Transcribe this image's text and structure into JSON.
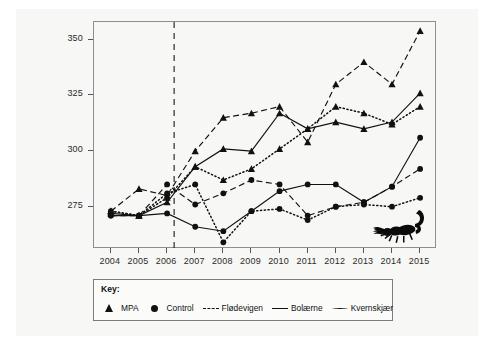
{
  "figure": {
    "background": "#f7f7f5",
    "frame_color": "#8e8e8e"
  },
  "chart_data": {
    "type": "line",
    "title": "",
    "xlabel": "",
    "ylabel": "90% percentile / mm",
    "x": [
      2004,
      2005,
      2006,
      2007,
      2008,
      2009,
      2010,
      2011,
      2012,
      2013,
      2014,
      2015
    ],
    "xtick_labels": [
      "2004",
      "2005",
      "2006",
      "2007",
      "2008",
      "2009",
      "2010",
      "2011",
      "2012",
      "2013",
      "2014",
      "2015"
    ],
    "ytick_labels": [
      "275",
      "300",
      "325",
      "350"
    ],
    "yticks": [
      275,
      300,
      325,
      350
    ],
    "ylim": [
      256,
      358
    ],
    "xlim": [
      2003.4,
      2015.6
    ],
    "grid": false,
    "legend_position": "below-plot",
    "annotations": [
      {
        "name": "protection-start-line",
        "type": "vline",
        "x": 2006.25,
        "style": "dashed"
      },
      {
        "name": "scorpion-illustration",
        "type": "image",
        "x": 2014.3,
        "y": 262
      }
    ],
    "series": [
      {
        "name": "Flødevigen MPA",
        "site": "Flødevigen",
        "group": "MPA",
        "marker": "triangle",
        "line_style": "dashed",
        "color": "#111111",
        "values": [
          273,
          283,
          280,
          300,
          315,
          317,
          320,
          304,
          330,
          340,
          330,
          354
        ]
      },
      {
        "name": "Bolærne MPA",
        "site": "Bolærne",
        "group": "MPA",
        "marker": "triangle",
        "line_style": "solid",
        "color": "#111111",
        "values": [
          272,
          271,
          277,
          293,
          301,
          300,
          317,
          310,
          313,
          310,
          313,
          326
        ]
      },
      {
        "name": "Kvernskjær MPA",
        "site": "Kvernskjær",
        "group": "MPA",
        "marker": "triangle",
        "line_style": "dotted",
        "color": "#111111",
        "values": [
          273,
          271,
          279,
          293,
          287,
          292,
          301,
          310,
          320,
          317,
          312,
          320
        ]
      },
      {
        "name": "Flødevigen Control",
        "site": "Flødevigen",
        "group": "Control",
        "marker": "circle",
        "line_style": "dashed",
        "color": "#111111",
        "values": [
          271,
          271,
          285,
          276,
          281,
          287,
          285,
          271,
          275,
          277,
          284,
          292
        ]
      },
      {
        "name": "Bolærne Control",
        "site": "Bolærne",
        "group": "Control",
        "marker": "circle",
        "line_style": "solid",
        "color": "#111111",
        "values": [
          271,
          271,
          272,
          266,
          264,
          273,
          282,
          285,
          285,
          277,
          284,
          306
        ]
      },
      {
        "name": "Kvernskjær Control",
        "site": "Kvernskjær",
        "group": "Control",
        "marker": "circle",
        "line_style": "dotted",
        "color": "#111111",
        "values": [
          273,
          271,
          281,
          285,
          259,
          273,
          274,
          269,
          275,
          276,
          275,
          279
        ]
      }
    ]
  },
  "key": {
    "title": "Key:",
    "entries": [
      {
        "glyph": "triangle-marker-icon",
        "label": "MPA"
      },
      {
        "glyph": "circle-marker-icon",
        "label": "Control"
      },
      {
        "glyph": "dashed-line-icon",
        "label": "Flødevigen"
      },
      {
        "glyph": "solid-line-icon",
        "label": "Bolærne"
      },
      {
        "glyph": "dotted-line-icon",
        "label": "Kvernskjær"
      }
    ]
  }
}
